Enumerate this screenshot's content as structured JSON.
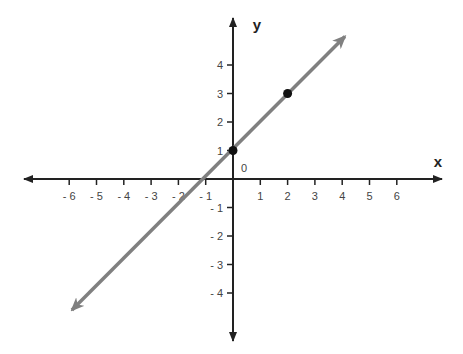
{
  "chart_data": {
    "type": "line",
    "title": "",
    "xlabel": "x",
    "ylabel": "y",
    "origin_label": "0",
    "xlim": [
      -7,
      7
    ],
    "ylim": [
      -5,
      5
    ],
    "grid": false,
    "x_ticks": [
      -6,
      -5,
      -4,
      -3,
      -2,
      -1,
      1,
      2,
      3,
      4,
      5,
      6
    ],
    "x_tick_labels": [
      "- 6",
      "- 5",
      "- 4",
      "- 3",
      "- 2",
      "- 1",
      "1",
      "2",
      "3",
      "4",
      "5",
      "6"
    ],
    "y_ticks": [
      4,
      3,
      2,
      1,
      -1,
      -2,
      -3,
      -4
    ],
    "y_tick_labels": [
      "4",
      "3",
      "2",
      "1",
      "- 1",
      "- 2",
      "- 3",
      "- 4"
    ],
    "series": [
      {
        "name": "y = x + 1",
        "slope": 1,
        "intercept": 1,
        "color": "#808080",
        "endpoints": [
          [
            -5.9,
            -4.6
          ],
          [
            4.1,
            5.0
          ]
        ],
        "arrows": "both"
      }
    ],
    "points": [
      {
        "x": 0,
        "y": 1,
        "color": "#111111"
      },
      {
        "x": 2,
        "y": 3,
        "color": "#111111"
      }
    ]
  },
  "colors": {
    "axis": "#222222",
    "line": "#808080",
    "point": "#111111",
    "tick_label": "#444444"
  }
}
